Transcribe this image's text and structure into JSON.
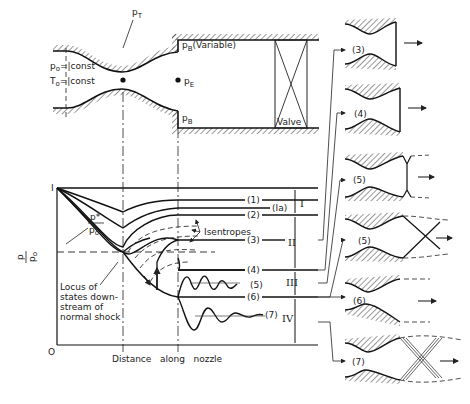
{
  "nozzle_schematic": {
    "p0_label": "p",
    "p0_sub": "o",
    "p0_value": "=|const",
    "T0_label": "T",
    "T0_sub": "o",
    "T0_value": "=|const",
    "throat_label": "p",
    "throat_sub": "T",
    "exit_label": "p",
    "exit_sub": "E",
    "back_top_label": "p",
    "back_top_sub": "B",
    "back_top_note": "(Variable)",
    "back_bottom_label": "p",
    "back_bottom_sub": "B",
    "valve_label": "Valve"
  },
  "graph": {
    "y_axis_label_num": "p",
    "y_axis_label_den": "p",
    "y_axis_label_den_sub": "o",
    "y_tick_top": "I",
    "y_tick_bottom": "O",
    "pstar_num": "p*",
    "pstar_den": "p",
    "pstar_den_sub": "o",
    "x_axis_label": "Distance   along   nozzle",
    "isentropes_label": "Isentropes",
    "locus_label_lines": [
      "Locus of",
      "states down-",
      "stream of",
      "normal shock"
    ],
    "curve_labels": [
      "(1)",
      "(Ia)",
      "(2)",
      "(3)",
      "(4)",
      "(5)",
      "(6)",
      "(7)"
    ],
    "regions": [
      "I",
      "II",
      "III",
      "IV"
    ]
  },
  "sketches": [
    {
      "label": "(3)"
    },
    {
      "label": "(4)"
    },
    {
      "label": "(5)"
    },
    {
      "label": "(5)"
    },
    {
      "label": "(6)"
    },
    {
      "label": "(7)"
    }
  ]
}
